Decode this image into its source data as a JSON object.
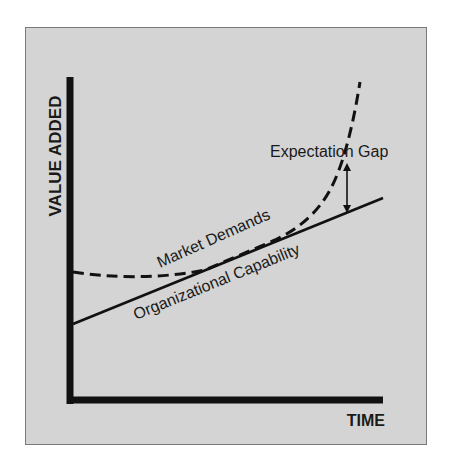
{
  "diagram": {
    "y_axis_label": "VALUE ADDED",
    "x_axis_label": "TIME",
    "curves": {
      "market_demands": {
        "label": "Market Demands",
        "style": "dashed"
      },
      "organizational_capability": {
        "label": "Organizational Capability",
        "style": "solid"
      }
    },
    "annotation": {
      "label": "Expectation Gap",
      "type": "double-arrow"
    },
    "colors": {
      "panel_background": "#d4d4d4",
      "panel_border": "#7a7a7a",
      "ink": "#111111"
    }
  }
}
